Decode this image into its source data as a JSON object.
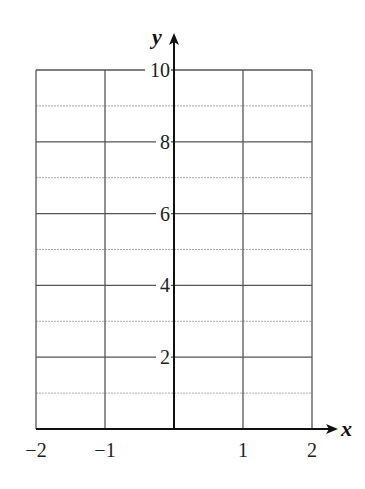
{
  "chart_data": {
    "type": "line",
    "title": "",
    "xlabel": "x",
    "ylabel": "y",
    "xlim": [
      -2,
      2
    ],
    "ylim": [
      0,
      10
    ],
    "x_ticks": [
      -2,
      -1,
      1,
      2
    ],
    "x_tick_labels": [
      "−2",
      "−1",
      "1",
      "2"
    ],
    "y_ticks": [
      2,
      4,
      6,
      8,
      10
    ],
    "y_tick_labels": [
      "2",
      "4",
      "6",
      "8",
      "10"
    ],
    "grid": {
      "major_x": [
        -2,
        -1,
        0,
        1,
        2
      ],
      "major_y": [
        0,
        2,
        4,
        6,
        8,
        10
      ],
      "minor_y_dashed": [
        1,
        3,
        5,
        7,
        9
      ]
    },
    "series": [],
    "legend": null,
    "note": "Blank coordinate grid with axes; no plotted data"
  },
  "colors": {
    "grid_major": "#555555",
    "grid_minor": "#aaaaaa",
    "axis": "#111111",
    "text": "#222222"
  }
}
